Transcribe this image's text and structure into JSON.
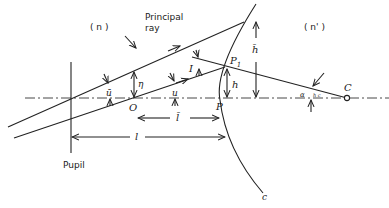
{
  "diagram": {
    "labels": {
      "medium_left": "( n )",
      "medium_right": "( n' )",
      "principal_ray_line1": "Principal",
      "principal_ray_line2": "ray",
      "pupil": "Pupil",
      "object_point": "O",
      "surface_vertex": "P",
      "intersection_point": "P",
      "intersection_subscript": "1",
      "center_of_curvature": "C",
      "surface_curvature": "c",
      "angle_incidence": "I",
      "angle_u": "u",
      "angle_u_bar": "ū",
      "height_eta": "η",
      "height_h": "h",
      "height_h_bar": "h̄",
      "distance_l": "l",
      "distance_l_bar": "l̄",
      "angle_at_C": "α",
      "angle_at_C_sub": "h c"
    },
    "colors": {
      "line": "#222222",
      "background": "#ffffff"
    }
  }
}
